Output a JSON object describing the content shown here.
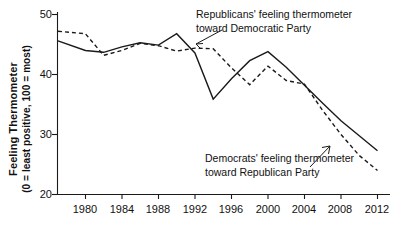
{
  "chart_data": {
    "type": "line",
    "title": "",
    "xlabel": "",
    "ylabel": "Feeling Thermometer (0 = least positive, 100 = most)",
    "ylabel_line1": "Feeling Thermometer",
    "ylabel_line2": "(0 = least positive, 100 = most)",
    "xlim": [
      1977,
      2012
    ],
    "ylim": [
      20,
      50
    ],
    "yticks": [
      20,
      30,
      40,
      50
    ],
    "ytick_labels": [
      "20",
      "30",
      "40",
      "50"
    ],
    "xticks": [
      1980,
      1984,
      1988,
      1992,
      1996,
      2000,
      2004,
      2008,
      2012
    ],
    "xtick_labels": [
      "1980",
      "1984",
      "1988",
      "1992",
      "1996",
      "2000",
      "2004",
      "2008",
      "2012"
    ],
    "grid": false,
    "legend_position": "inline-annotations",
    "x": [
      1977,
      1980,
      1982,
      1984,
      1986,
      1988,
      1990,
      1992,
      1994,
      1996,
      1998,
      2000,
      2002,
      2004,
      2006,
      2008,
      2010,
      2012
    ],
    "series": [
      {
        "name": "Republicans' feeling thermometer toward Democratic Party",
        "style": "solid",
        "color": "#1a1a1a",
        "values": [
          45.6,
          44.0,
          43.7,
          44.6,
          45.3,
          44.9,
          46.8,
          43.6,
          35.9,
          39.3,
          42.3,
          43.8,
          41.2,
          38.2,
          35.2,
          32.3,
          29.8,
          27.3
        ]
      },
      {
        "name": "Democrats' feeling thermometer toward Republican Party",
        "style": "dashed",
        "color": "#1a1a1a",
        "values": [
          47.2,
          46.8,
          43.2,
          44.0,
          45.2,
          44.8,
          43.9,
          44.4,
          44.3,
          41.1,
          38.3,
          41.4,
          39.0,
          38.4,
          34.0,
          30.0,
          26.5,
          24.0
        ]
      }
    ],
    "annotations": [
      {
        "id": "annotation-republicans",
        "line1": "Republicans' feeling thermometer",
        "line2": "toward Democratic Party",
        "points_to_series": "Republicans' feeling thermometer toward Democratic Party"
      },
      {
        "id": "annotation-democrats",
        "line1": "Democrats' feeling thermometer",
        "line2": "toward Republican Party",
        "points_to_series": "Democrats' feeling thermometer toward Republican Party"
      }
    ]
  }
}
